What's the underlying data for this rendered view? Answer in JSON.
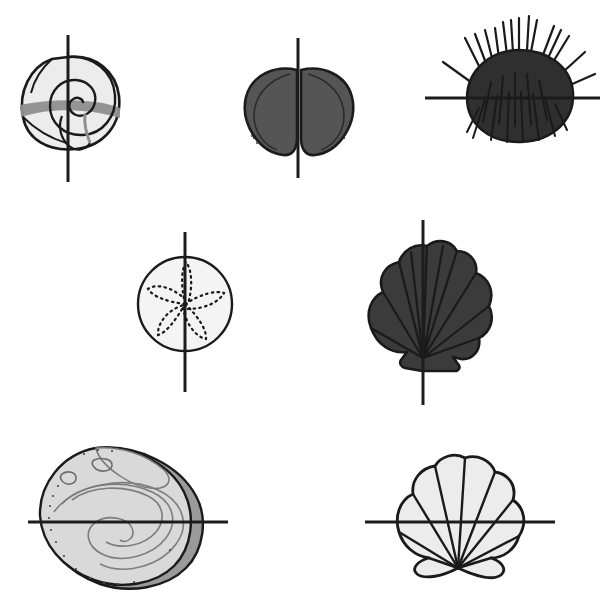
{
  "page": {
    "background_color": "#ffffff",
    "width": 612,
    "height": 595
  },
  "palette": {
    "ink": "#1a1a1a",
    "line": "#1c1c1c",
    "shell_light": "#ececec",
    "shell_light_alt": "#e3e3e3",
    "shell_mid_gray": "#8f8f8f",
    "shell_dark_gray": "#4f4f4f",
    "shell_darker_gray": "#3b3b3b",
    "shell_darkest": "#2b2b2b",
    "shell_shadow": "#9a9a9a"
  },
  "figures": [
    {
      "id": "snail-shell",
      "name": "Spiral Snail Shell",
      "row": 1,
      "column": 1,
      "fill": "#ececec",
      "accent_fill": "#8f8f8f",
      "symmetry_line": {
        "orientation": "vertical",
        "label": "vertical line of symmetry",
        "x": 68,
        "y1": 35,
        "y2": 182
      },
      "bounds": {
        "x": 20,
        "y": 50,
        "width": 100,
        "height": 108
      }
    },
    {
      "id": "clam-shell",
      "name": "Clam Bivalve Shell",
      "row": 1,
      "column": 2,
      "fill": "#555555",
      "accent_fill": "#2b2b2b",
      "symmetry_line": {
        "orientation": "vertical",
        "label": "vertical line of symmetry",
        "x": 298,
        "y1": 38,
        "y2": 178
      },
      "bounds": {
        "x": 245,
        "y": 68,
        "width": 106,
        "height": 88
      }
    },
    {
      "id": "sea-urchin",
      "name": "Spiny Sea Urchin",
      "row": 1,
      "column": 3,
      "fill": "#2f2f2f",
      "accent_fill": "#1a1a1a",
      "symmetry_line": {
        "orientation": "horizontal",
        "label": "horizontal line of symmetry",
        "y": 98,
        "x1": 425,
        "x2": 600
      },
      "bounds": {
        "x": 443,
        "y": 35,
        "width": 140,
        "height": 110
      }
    },
    {
      "id": "sand-dollar",
      "name": "Sand Dollar",
      "row": 2,
      "column": 1,
      "fill": "#f4f4f4",
      "accent_fill": "#1a1a1a",
      "symmetry_line": {
        "orientation": "vertical",
        "label": "vertical line of symmetry",
        "x": 185,
        "y1": 232,
        "y2": 392
      },
      "bounds": {
        "x": 140,
        "y": 258,
        "width": 92,
        "height": 92
      }
    },
    {
      "id": "dark-scallop-shell",
      "name": "Dark Scallop Shell",
      "row": 2,
      "column": 2,
      "fill": "#3b3b3b",
      "accent_fill": "#1a1a1a",
      "symmetry_line": {
        "orientation": "vertical",
        "label": "vertical line of symmetry",
        "x": 422,
        "y1": 220,
        "y2": 405
      },
      "bounds": {
        "x": 358,
        "y": 253,
        "width": 130,
        "height": 118
      }
    },
    {
      "id": "abalone-shell",
      "name": "Abalone Shell",
      "row": 3,
      "column": 1,
      "fill": "#d9d9d9",
      "accent_fill": "#9a9a9a",
      "symmetry_line": {
        "orientation": "horizontal",
        "label": "horizontal line of symmetry",
        "y": 522,
        "x1": 28,
        "x2": 228
      },
      "bounds": {
        "x": 48,
        "y": 446,
        "width": 160,
        "height": 148
      }
    },
    {
      "id": "light-scallop-shell",
      "name": "Light Scallop Shell",
      "row": 3,
      "column": 2,
      "fill": "#ececec",
      "accent_fill": "#1a1a1a",
      "symmetry_line": {
        "orientation": "horizontal",
        "label": "horizontal line of symmetry",
        "y": 522,
        "x1": 365,
        "x2": 555
      },
      "bounds": {
        "x": 400,
        "y": 458,
        "width": 118,
        "height": 110
      }
    }
  ]
}
